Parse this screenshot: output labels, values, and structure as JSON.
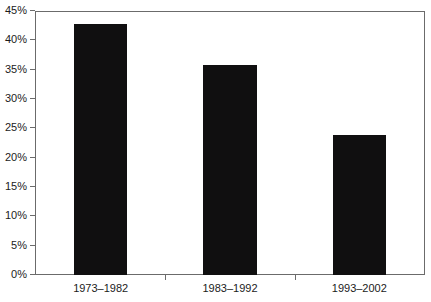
{
  "chart_data": {
    "type": "bar",
    "title": "",
    "subtitle": "",
    "xlabel": "",
    "ylabel": "",
    "categories": [
      "1973–1982",
      "1983–1992",
      "1993–2002"
    ],
    "values": [
      43,
      36,
      24
    ],
    "value_labels": [
      "43%",
      "36%",
      "24%"
    ],
    "ylim": [
      0,
      45
    ],
    "ytick_values": [
      0,
      5,
      10,
      15,
      20,
      25,
      30,
      35,
      40,
      45
    ],
    "ytick_labels": [
      "0%",
      "5%",
      "10%",
      "15%",
      "20%",
      "25%",
      "30%",
      "35%",
      "40%",
      "45%"
    ],
    "grid": false,
    "legend": null,
    "legend_position": "none",
    "series": [
      {
        "name": "",
        "values": [
          43,
          36,
          24
        ],
        "color": "#100f10"
      }
    ],
    "colors": {
      "bar_fill": "#100f10",
      "axis_line": "#6b6b6b",
      "tick_label": "#1b1b1b",
      "background": "#ffffff"
    }
  }
}
